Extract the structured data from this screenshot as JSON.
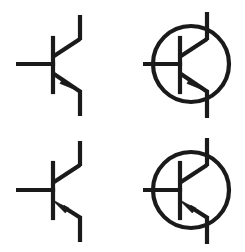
{
  "diagram": {
    "background_color": "#ffffff",
    "stroke_color": "#1a1a1a",
    "stroke_width": 4.2,
    "canvas": {
      "width": 245,
      "height": 252
    },
    "layout": {
      "type": "grid",
      "rows": 2,
      "columns": 2
    },
    "symbols": [
      {
        "id": "npn-open",
        "name": "NPN transistor (no envelope)",
        "polarity": "NPN",
        "envelope": false,
        "arrow_direction": "outward-down-right",
        "arrow_on": "emitter",
        "cell": {
          "row": 0,
          "column": 0
        },
        "geometry": {
          "base_bar": {
            "x": 53,
            "y_top": 38,
            "y_bottom": 92
          },
          "base_lead": {
            "x_start": 16,
            "x_end": 53,
            "y": 64
          },
          "collector_diagonal": {
            "x1": 53,
            "y1": 56,
            "x2": 80,
            "y2": 38
          },
          "collector_lead": {
            "x": 80,
            "y_top": 15,
            "y_bottom": 38
          },
          "emitter_diagonal": {
            "x1": 53,
            "y1": 74,
            "x2": 80,
            "y2": 92
          },
          "emitter_lead": {
            "x": 80,
            "y_top": 92,
            "y_bottom": 116
          },
          "arrow_tip": {
            "x": 75,
            "y": 88
          }
        }
      },
      {
        "id": "npn-circled",
        "name": "NPN transistor (circular envelope)",
        "polarity": "NPN",
        "envelope": true,
        "arrow_direction": "outward-down-right",
        "arrow_on": "emitter",
        "cell": {
          "row": 0,
          "column": 1
        },
        "geometry": {
          "envelope_circle": {
            "cx": 191,
            "cy": 64,
            "r": 38
          },
          "base_bar": {
            "x": 180,
            "y_top": 38,
            "y_bottom": 92
          },
          "base_lead": {
            "x_start": 143,
            "x_end": 180,
            "y": 64
          },
          "collector_diagonal": {
            "x1": 180,
            "y1": 56,
            "x2": 207,
            "y2": 38
          },
          "collector_lead": {
            "x": 207,
            "y_top": 12,
            "y_bottom": 38
          },
          "emitter_diagonal": {
            "x1": 180,
            "y1": 74,
            "x2": 207,
            "y2": 92
          },
          "emitter_lead": {
            "x": 207,
            "y_top": 92,
            "y_bottom": 118
          },
          "arrow_tip": {
            "x": 202,
            "y": 88
          }
        }
      },
      {
        "id": "pnp-open",
        "name": "PNP transistor (no envelope)",
        "polarity": "PNP",
        "envelope": false,
        "arrow_direction": "inward-up-left",
        "arrow_on": "emitter",
        "cell": {
          "row": 1,
          "column": 0
        },
        "geometry": {
          "base_bar": {
            "x": 53,
            "y_top": 163,
            "y_bottom": 218
          },
          "base_lead": {
            "x_start": 16,
            "x_end": 53,
            "y": 190
          },
          "collector_diagonal": {
            "x1": 53,
            "y1": 182,
            "x2": 80,
            "y2": 164
          },
          "collector_lead": {
            "x": 80,
            "y_top": 141,
            "y_bottom": 164
          },
          "emitter_diagonal": {
            "x1": 53,
            "y1": 200,
            "x2": 80,
            "y2": 218
          },
          "emitter_lead": {
            "x": 80,
            "y_top": 218,
            "y_bottom": 242
          },
          "arrow_tip": {
            "x": 56,
            "y": 198
          }
        }
      },
      {
        "id": "pnp-circled",
        "name": "PNP transistor (circular envelope)",
        "polarity": "PNP",
        "envelope": true,
        "arrow_direction": "inward-up-left",
        "arrow_on": "emitter",
        "cell": {
          "row": 1,
          "column": 1
        },
        "geometry": {
          "envelope_circle": {
            "cx": 191,
            "cy": 190,
            "r": 38
          },
          "base_bar": {
            "x": 180,
            "y_top": 163,
            "y_bottom": 218
          },
          "base_lead": {
            "x_start": 143,
            "x_end": 180,
            "y": 190
          },
          "collector_diagonal": {
            "x1": 180,
            "y1": 182,
            "x2": 207,
            "y2": 164
          },
          "collector_lead": {
            "x": 207,
            "y_top": 138,
            "y_bottom": 164
          },
          "emitter_diagonal": {
            "x1": 180,
            "y1": 200,
            "x2": 207,
            "y2": 218
          },
          "emitter_lead": {
            "x": 207,
            "y_top": 218,
            "y_bottom": 244
          },
          "arrow_tip": {
            "x": 183,
            "y": 198
          }
        }
      }
    ]
  }
}
